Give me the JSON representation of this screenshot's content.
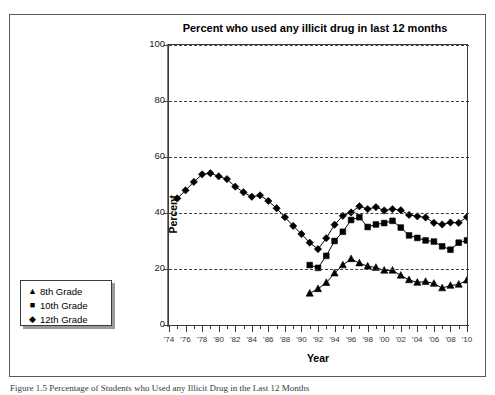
{
  "figure": {
    "caption": "Figure 1.5  Percentage of Students who Used any Illicit Drug in the Last 12 Months"
  },
  "chart_data": {
    "type": "line",
    "title": "Percent who used any illicit drug in last 12 months",
    "xlabel": "Year",
    "ylabel": "Percent",
    "xlim": [
      1974,
      2010
    ],
    "ylim": [
      0,
      100
    ],
    "ytick_values": [
      0,
      20,
      40,
      60,
      80,
      100
    ],
    "ytick_labels": [
      "0",
      "20",
      "40",
      "60",
      "80",
      "100"
    ],
    "xtick_values": [
      1974,
      1976,
      1978,
      1980,
      1982,
      1984,
      1986,
      1988,
      1990,
      1992,
      1994,
      1996,
      1998,
      2000,
      2002,
      2004,
      2006,
      2008,
      2010
    ],
    "xtick_labels": [
      "'74",
      "'76",
      "'78",
      "'80",
      "'82",
      "'84",
      "'86",
      "'88",
      "'90",
      "'92",
      "'94",
      "'96",
      "'98",
      "'00",
      "'02",
      "'04",
      "'06",
      "'08",
      "'10"
    ],
    "grid": true,
    "grid_axis": "y",
    "grid_style": "dashed",
    "legend_position": "outside-left-lower",
    "series": [
      {
        "name": "8th Grade",
        "marker": "triangle",
        "legend_glyph": "▲",
        "color": "#000000",
        "x": [
          1991,
          1992,
          1993,
          1994,
          1995,
          1996,
          1997,
          1998,
          1999,
          2000,
          2001,
          2002,
          2003,
          2004,
          2005,
          2006,
          2007,
          2008,
          2009,
          2010
        ],
        "y": [
          11.3,
          12.9,
          15.1,
          18.5,
          21.4,
          23.6,
          22.1,
          21.0,
          20.5,
          19.5,
          19.5,
          17.7,
          16.1,
          15.2,
          15.5,
          14.8,
          13.2,
          14.1,
          14.5,
          16.0
        ]
      },
      {
        "name": "10th Grade",
        "marker": "square",
        "legend_glyph": "■",
        "color": "#000000",
        "x": [
          1991,
          1992,
          1993,
          1994,
          1995,
          1996,
          1997,
          1998,
          1999,
          2000,
          2001,
          2002,
          2003,
          2004,
          2005,
          2006,
          2007,
          2008,
          2009,
          2010
        ],
        "y": [
          21.4,
          20.4,
          24.7,
          30.0,
          33.3,
          37.5,
          38.5,
          35.0,
          35.9,
          36.4,
          37.2,
          34.8,
          32.0,
          31.1,
          30.2,
          29.8,
          28.1,
          26.9,
          29.4,
          30.2
        ]
      },
      {
        "name": "12th Grade",
        "marker": "diamond",
        "legend_glyph": "◆",
        "color": "#000000",
        "x": [
          1975,
          1976,
          1977,
          1978,
          1979,
          1980,
          1981,
          1982,
          1983,
          1984,
          1985,
          1986,
          1987,
          1988,
          1989,
          1990,
          1991,
          1992,
          1993,
          1994,
          1995,
          1996,
          1997,
          1998,
          1999,
          2000,
          2001,
          2002,
          2003,
          2004,
          2005,
          2006,
          2007,
          2008,
          2009,
          2010
        ],
        "y": [
          45.2,
          48.1,
          51.1,
          53.8,
          54.2,
          53.1,
          52.1,
          49.4,
          47.4,
          45.8,
          46.3,
          44.3,
          41.7,
          38.5,
          35.4,
          32.5,
          29.4,
          27.1,
          31.0,
          35.8,
          39.0,
          40.2,
          42.4,
          41.4,
          42.1,
          40.9,
          41.4,
          41.0,
          39.3,
          38.8,
          38.4,
          36.5,
          35.9,
          36.6,
          36.5,
          38.6
        ]
      }
    ]
  },
  "legend": {
    "items": [
      {
        "glyph": "▲",
        "label": "8th Grade"
      },
      {
        "glyph": "■",
        "label": "10th Grade"
      },
      {
        "glyph": "◆",
        "label": "12th Grade"
      }
    ]
  }
}
